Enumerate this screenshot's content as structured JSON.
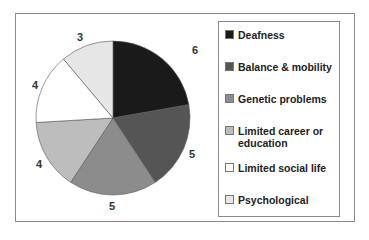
{
  "chart_data": {
    "type": "pie",
    "title": "",
    "categories": [
      "Deafness",
      "Balance & mobility",
      "Genetic problems",
      "Limited career or education",
      "Limited social life",
      "Psychological"
    ],
    "values": [
      6,
      5,
      5,
      4,
      4,
      3
    ],
    "colors": [
      "#1a1a1a",
      "#555555",
      "#8c8c8c",
      "#bdbdbd",
      "#ffffff",
      "#e6e6e6"
    ],
    "legend_position": "right"
  },
  "labels": [
    "6",
    "5",
    "5",
    "4",
    "4",
    "3"
  ],
  "legend": [
    {
      "label": "Deafness"
    },
    {
      "label": "Balance & mobility"
    },
    {
      "label": "Genetic problems"
    },
    {
      "label": "Limited career or education",
      "line1": "Limited career or",
      "line2": "education"
    },
    {
      "label": "Limited social life"
    },
    {
      "label": "Psychological"
    }
  ]
}
